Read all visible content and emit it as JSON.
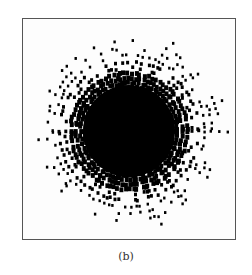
{
  "figure": {
    "caption": "(b)",
    "content": "radial scatter pattern: dense black disc with outward radiating dot streaks",
    "colors": {
      "ink": "#000000",
      "background": "#ffffff",
      "border": "#555555"
    }
  }
}
